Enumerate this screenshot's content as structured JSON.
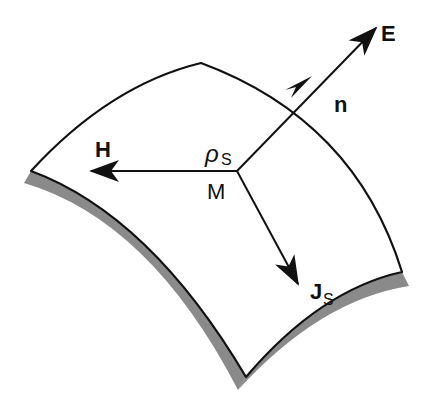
{
  "diagram": {
    "colors": {
      "line": "#111111",
      "surface": "#ffffff",
      "shadow": "#8a8a8a"
    },
    "labels": {
      "E": "E",
      "n": "n",
      "H": "H",
      "rho_main": "ρ",
      "rho_sub": "S",
      "M": "M",
      "J_main": "J",
      "J_sub": "S"
    },
    "vectors": [
      {
        "name": "E",
        "meaning": "electric field",
        "direction": "up-right"
      },
      {
        "name": "n",
        "meaning": "surface normal",
        "direction": "up-right"
      },
      {
        "name": "H",
        "meaning": "magnetic field",
        "direction": "left"
      },
      {
        "name": "J_S",
        "meaning": "surface current density",
        "direction": "down-right"
      }
    ],
    "point": {
      "name": "M",
      "quantity": "ρ_S (surface charge density)"
    }
  }
}
